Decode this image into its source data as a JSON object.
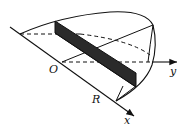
{
  "diagram": {
    "type": "3d-solid-wedge-cross-section",
    "labels": {
      "origin": "O",
      "radius": "R",
      "x_axis": "x",
      "y_axis": "y"
    },
    "colors": {
      "line": "#111111",
      "cross_section_fill": "#2a2a2a",
      "background": "#ffffff"
    }
  }
}
